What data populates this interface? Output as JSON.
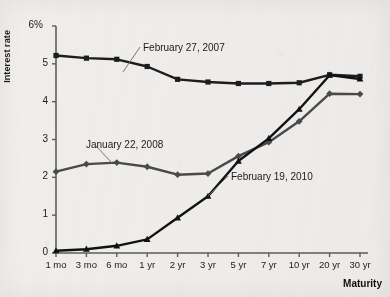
{
  "chart_data": {
    "type": "line",
    "title": "",
    "xlabel": "Maturity",
    "ylabel": "Interest rate",
    "categories": [
      "1 mo",
      "3 mo",
      "6 mo",
      "1 yr",
      "2 yr",
      "3 yr",
      "5 yr",
      "7 yr",
      "10 yr",
      "20 yr",
      "30 yr"
    ],
    "ylim": [
      0,
      6
    ],
    "yticks": [
      "0",
      "1",
      "2",
      "3",
      "4",
      "5",
      "6%"
    ],
    "ytick_values": [
      0,
      1,
      2,
      3,
      4,
      5,
      6
    ],
    "grid": false,
    "legend_position": "inline-annotations",
    "series": [
      {
        "name": "February 27, 2007",
        "marker": "square",
        "color": "#1d1d1d",
        "values": [
          5.22,
          5.15,
          5.12,
          4.93,
          4.59,
          4.52,
          4.48,
          4.48,
          4.5,
          4.71,
          4.67
        ]
      },
      {
        "name": "January 22, 2008",
        "marker": "diamond",
        "color": "#4a4a4a",
        "values": [
          2.15,
          2.35,
          2.39,
          2.28,
          2.07,
          2.1,
          2.56,
          2.93,
          3.48,
          4.21,
          4.2
        ]
      },
      {
        "name": "February 19, 2010",
        "marker": "triangle",
        "color": "#121212",
        "values": [
          0.06,
          0.1,
          0.19,
          0.36,
          0.93,
          1.5,
          2.43,
          3.03,
          3.8,
          4.7,
          4.6
        ]
      }
    ],
    "annotations": [
      {
        "text": "February 27, 2007",
        "x_px": 143,
        "y_px": 42
      },
      {
        "text": "January 22, 2008",
        "x_px": 86,
        "y_px": 139
      },
      {
        "text": "February 19, 2010",
        "x_px": 231,
        "y_px": 171
      }
    ]
  },
  "axis": {
    "y_title": "Interest rate",
    "x_title": "Maturity"
  }
}
